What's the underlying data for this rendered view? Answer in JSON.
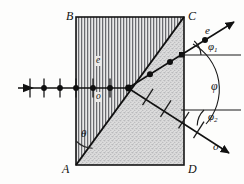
{
  "figure": {
    "type": "optics-ray-diagram",
    "corners": [
      {
        "name": "B",
        "label": "B",
        "x": 66,
        "y": 16,
        "position": "top-left"
      },
      {
        "name": "C",
        "label": "C",
        "x": 188,
        "y": 16,
        "position": "top-right"
      },
      {
        "name": "A",
        "label": "A",
        "x": 64,
        "y": 164,
        "position": "bottom-left"
      },
      {
        "name": "D",
        "label": "D",
        "x": 188,
        "y": 164,
        "position": "bottom-right"
      }
    ],
    "inner_labels": [
      {
        "name": "e-ray-inside",
        "label": "e",
        "x": 96,
        "y": 60
      },
      {
        "name": "o-ray-inside",
        "label": "o",
        "x": 96,
        "y": 93
      }
    ],
    "exit_labels": [
      {
        "name": "e-ray-exit",
        "label": "e",
        "x": 206,
        "y": 30
      },
      {
        "name": "o-ray-exit",
        "label": "o",
        "x": 214,
        "y": 146
      }
    ],
    "angles": [
      {
        "name": "theta",
        "label": "θ",
        "x": 84,
        "y": 133
      },
      {
        "name": "phi-1",
        "label": "φ",
        "sub": "1",
        "x": 212,
        "y": 50
      },
      {
        "name": "phi",
        "label": "φ",
        "sub": "",
        "x": 212,
        "y": 87
      },
      {
        "name": "phi-2",
        "label": "φ",
        "sub": "2",
        "x": 212,
        "y": 117
      }
    ],
    "prism": {
      "left_section_fill": "vertical-line-hatch",
      "right_section_fill": "stipple-dots",
      "outline_color": "#1a1a1a",
      "hatch_color": "#55565a",
      "stipple_color": "#8d8e90",
      "rect": {
        "x": 76,
        "y": 17,
        "width": 108,
        "height": 148
      }
    },
    "rays": {
      "incident": {
        "name": "incident-unpolarized-ray",
        "from": {
          "x": 18,
          "y": 88
        },
        "to": {
          "x": 128,
          "y": 88
        },
        "marker_style": "dot-and-bar",
        "marker_count": 6
      },
      "e_exit": {
        "name": "extraordinary-exit-ray",
        "from": {
          "x": 128,
          "y": 88
        },
        "to": {
          "x": 233,
          "y": 22
        },
        "marker_style": "dot",
        "marker_count": 3
      },
      "o_exit": {
        "name": "ordinary-exit-ray",
        "from": {
          "x": 128,
          "y": 88
        },
        "to": {
          "x": 228,
          "y": 152
        },
        "marker_style": "bar",
        "marker_count": 4
      }
    },
    "reference_lines": [
      {
        "name": "phi1-reference-horizontal",
        "x1": 181,
        "y1": 55,
        "x2": 240,
        "y2": 55
      },
      {
        "name": "phi2-reference-horizontal",
        "x1": 181,
        "y1": 110,
        "x2": 240,
        "y2": 110
      }
    ]
  }
}
